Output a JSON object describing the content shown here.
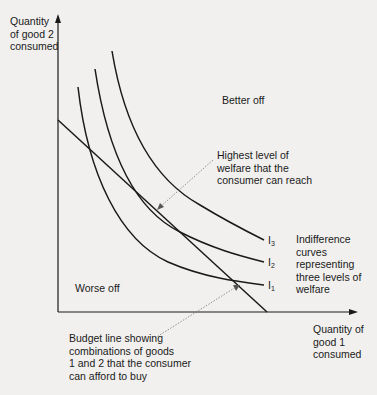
{
  "axes": {
    "y_label": [
      "Quantity",
      "of good 2",
      "consumed"
    ],
    "x_label": [
      "Quantity of",
      "good 1",
      "consumed"
    ]
  },
  "regions": {
    "better_off": "Better off",
    "worse_off": "Worse off"
  },
  "curves": [
    {
      "id": "I1",
      "letter": "I",
      "subscript": "1"
    },
    {
      "id": "I2",
      "letter": "I",
      "subscript": "2"
    },
    {
      "id": "I3",
      "letter": "I",
      "subscript": "3"
    }
  ],
  "annotations": {
    "highest_welfare": [
      "Highest level of",
      "welfare that the",
      "consumer can reach"
    ],
    "indifference_curves": [
      "Indifference",
      "curves",
      "representing",
      "three levels of",
      "welfare"
    ],
    "budget_line": [
      "Budget line showing",
      "combinations of goods",
      "1 and 2 that the consumer",
      "can afford to buy"
    ]
  },
  "colors": {
    "background": "#f1f0ee",
    "ink": "#1a1a1a",
    "dotted": "#777777"
  }
}
